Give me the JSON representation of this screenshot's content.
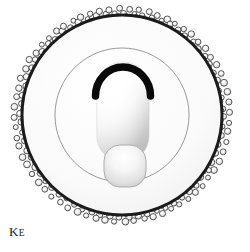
{
  "figure": {
    "label_main": "K",
    "label_subscript": "E",
    "label_full": "Kᴇ",
    "background_color": "#ffffff",
    "outline_color": "#1c1c1c",
    "ring_fill_color": "#f7f7f7",
    "inner_line_color": "#8c8c8c",
    "bead_fill_color": "#fcfcfc",
    "bead_stroke_color": "#3a3a3a",
    "cap_color": "#0a0a0a",
    "body_highlight_color": "#ffffff",
    "body_shadow_color": "#b9b9b9"
  },
  "diagram": {
    "type": "schematic-cross-section",
    "center": {
      "x": 122,
      "y": 115
    },
    "outer_circle": {
      "radius": 100,
      "stroke_width": 3
    },
    "ring_band": {
      "inner_radius": 67,
      "outer_radius": 100
    },
    "inner_circle": {
      "radius": 67,
      "stroke_width": 1
    },
    "corona": {
      "ring_radius": 101,
      "cluster_count": 34,
      "beads_per_cluster": 4,
      "bead_radius": 3.1
    },
    "body": {
      "shape": "rounded-capsule",
      "x": 97,
      "y": 62,
      "width": 52,
      "height": 100,
      "corner_radius": 26
    },
    "cap": {
      "shape": "arc-hood",
      "stroke_width": 7,
      "span_degrees": 170
    },
    "bulb": {
      "shape": "rounded-rect",
      "x": 104,
      "y": 145,
      "width": 42,
      "height": 42,
      "corner_radius": 16
    }
  }
}
